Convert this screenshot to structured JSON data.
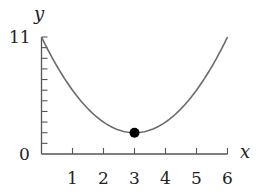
{
  "chart_data": {
    "type": "line",
    "title": "",
    "xlabel": "x",
    "ylabel": "y",
    "xlim": [
      0,
      6
    ],
    "ylim": [
      0,
      11
    ],
    "x_ticks": [
      1,
      2,
      3,
      4,
      5,
      6
    ],
    "x_tick_labels": [
      "1",
      "2",
      "3",
      "4",
      "5",
      "6"
    ],
    "y_ticks": [
      1,
      2,
      3,
      4,
      5,
      6,
      7,
      8,
      9,
      10,
      11
    ],
    "y_tick_labels": {
      "0": "0",
      "11": "11"
    },
    "grid": false,
    "legend": null,
    "series": [
      {
        "name": "parabola",
        "function": "y = (x - 3)^2 + 2",
        "x": [
          0,
          0.5,
          1,
          1.5,
          2,
          2.5,
          3,
          3.5,
          4,
          4.5,
          5,
          5.5,
          6
        ],
        "y": [
          11,
          8.25,
          6,
          4.25,
          3,
          2.25,
          2,
          2.25,
          3,
          4.25,
          6,
          8.25,
          11
        ],
        "color": "#6b6b6b"
      }
    ],
    "annotations": [
      {
        "type": "point",
        "label": "minimum",
        "x": 3,
        "y": 2,
        "color": "#000000"
      }
    ]
  },
  "labels": {
    "origin": "0",
    "y_max": "11",
    "x_axis": "x",
    "y_axis": "y"
  }
}
